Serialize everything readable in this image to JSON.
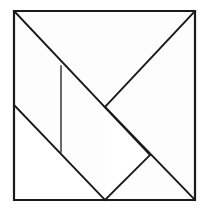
{
  "figure": {
    "type": "tangram-dissection-diagram",
    "background_color": "#ffffff",
    "fill_color": "#fdfdfd",
    "line_color": "#1a1a1a",
    "outline_width": 2.2,
    "cut_width": 1.9,
    "thin_cut_width": 1.3,
    "square": {
      "left": 14,
      "top": 11,
      "right": 195,
      "bottom": 200,
      "outline_points": "14,11 195,11 195,200 14,200"
    },
    "vertices": {
      "top_left": "14,11",
      "top_right": "195,11",
      "bottom_right": "195,200",
      "bottom_left": "14,200",
      "left_mid": "14,105",
      "bottom_mid": "105,200",
      "center": "105,107",
      "upper_cut": "61,66",
      "lower_cut": "61,152",
      "right_cut": "150,155"
    },
    "cut_lines": [
      {
        "name": "main-diagonal-tl-br",
        "points": "14,11 150,155",
        "width": 1.9
      },
      {
        "name": "diagonal-tr-center",
        "points": "195,11 105,107",
        "width": 1.9
      },
      {
        "name": "diagonal-left-bottom",
        "points": "14,105 105,200",
        "width": 1.9
      },
      {
        "name": "diagonal-center-bottomright",
        "points": "105,107 195,200",
        "width": 1.9
      },
      {
        "name": "diagonal-bottommid-rightcut",
        "points": "105,200 150,155",
        "width": 1.9
      },
      {
        "name": "vertical-cut",
        "points": "61,66 61,152",
        "width": 1.3
      }
    ],
    "pieces": [
      {
        "name": "large-triangle-upper",
        "points": "14,11 195,11 105,107"
      },
      {
        "name": "large-triangle-left",
        "points": "14,11 105,107 14,105"
      },
      {
        "name": "medium-triangle-right",
        "points": "105,107 195,11 195,200"
      },
      {
        "name": "small-triangle-left",
        "points": "14,105 61,152 61,66"
      },
      {
        "name": "small-triangle-bottom",
        "points": "61,152 105,200 105,107"
      },
      {
        "name": "square-piece",
        "points": "61,66 105,107 61,152"
      },
      {
        "name": "parallelogram-piece",
        "points": "105,200 150,155 195,200"
      }
    ]
  }
}
